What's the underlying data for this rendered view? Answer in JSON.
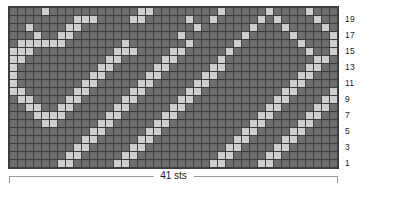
{
  "chart_data": {
    "type": "heatmap",
    "title": "",
    "subtitle": "",
    "xlabel": "41 sts",
    "ylabel": "",
    "columns": 41,
    "rows": 20,
    "grid_on": true,
    "legend_position": "none",
    "colors": {
      "background_stitch": "#6d6d6d",
      "contrast_stitch": "#cfcfcf",
      "cell_border": "#3f3f3f",
      "bracket": "#9a9a9a",
      "text": "#1c1c1c",
      "page_background": "#ffffff"
    },
    "legend_entries": [
      {
        "label": "background stitch",
        "value": 0,
        "color": "#6d6d6d"
      },
      {
        "label": "contrast stitch",
        "value": 1,
        "color": "#cfcfcf"
      }
    ],
    "row_labels": [
      "19",
      "17",
      "15",
      "13",
      "11",
      "9",
      "7",
      "5",
      "3",
      "1"
    ],
    "row_label_numbers": [
      19,
      17,
      15,
      13,
      11,
      9,
      7,
      5,
      3,
      1
    ],
    "row_label_side": "right",
    "row_order_top_to_bottom": [
      20,
      19,
      18,
      17,
      16,
      15,
      14,
      13,
      12,
      11,
      10,
      9,
      8,
      7,
      6,
      5,
      4,
      3,
      2,
      1
    ],
    "values": [
      [
        0,
        0,
        0,
        0,
        1,
        0,
        0,
        0,
        0,
        0,
        0,
        0,
        0,
        0,
        0,
        0,
        1,
        1,
        0,
        0,
        0,
        0,
        0,
        0,
        0,
        0,
        1,
        0,
        0,
        0,
        0,
        0,
        1,
        0,
        0,
        0,
        0,
        1,
        0,
        0,
        0
      ],
      [
        0,
        0,
        0,
        0,
        0,
        0,
        0,
        0,
        1,
        1,
        1,
        0,
        0,
        0,
        0,
        1,
        1,
        0,
        0,
        0,
        0,
        0,
        1,
        0,
        0,
        1,
        0,
        0,
        0,
        0,
        0,
        1,
        0,
        1,
        0,
        0,
        0,
        0,
        1,
        0,
        0
      ],
      [
        0,
        0,
        1,
        0,
        0,
        0,
        0,
        1,
        1,
        0,
        0,
        0,
        0,
        0,
        0,
        0,
        0,
        0,
        0,
        0,
        0,
        0,
        0,
        1,
        0,
        0,
        0,
        0,
        0,
        0,
        1,
        0,
        0,
        0,
        1,
        0,
        0,
        0,
        0,
        1,
        0
      ],
      [
        0,
        0,
        0,
        1,
        0,
        0,
        1,
        1,
        0,
        0,
        0,
        0,
        0,
        0,
        0,
        0,
        0,
        0,
        0,
        0,
        0,
        1,
        0,
        0,
        0,
        0,
        0,
        0,
        0,
        1,
        0,
        0,
        0,
        0,
        0,
        1,
        0,
        0,
        0,
        0,
        1
      ],
      [
        0,
        1,
        1,
        1,
        1,
        1,
        1,
        0,
        0,
        0,
        0,
        0,
        0,
        0,
        1,
        0,
        0,
        0,
        0,
        0,
        0,
        0,
        1,
        0,
        0,
        0,
        0,
        0,
        1,
        0,
        0,
        0,
        0,
        0,
        0,
        0,
        1,
        0,
        0,
        0,
        1
      ],
      [
        1,
        1,
        1,
        0,
        0,
        0,
        0,
        0,
        0,
        0,
        0,
        0,
        0,
        1,
        1,
        1,
        0,
        0,
        0,
        0,
        1,
        1,
        0,
        0,
        0,
        0,
        0,
        1,
        0,
        0,
        0,
        0,
        0,
        0,
        0,
        0,
        0,
        1,
        0,
        0,
        1
      ],
      [
        1,
        1,
        0,
        0,
        0,
        0,
        0,
        0,
        0,
        0,
        0,
        0,
        1,
        1,
        0,
        0,
        0,
        0,
        0,
        1,
        1,
        0,
        0,
        0,
        0,
        0,
        1,
        0,
        0,
        0,
        0,
        0,
        0,
        0,
        0,
        0,
        0,
        0,
        1,
        1,
        0
      ],
      [
        1,
        0,
        0,
        0,
        0,
        0,
        0,
        0,
        0,
        0,
        0,
        1,
        1,
        0,
        0,
        0,
        0,
        0,
        1,
        1,
        0,
        0,
        0,
        0,
        0,
        1,
        1,
        0,
        0,
        0,
        0,
        0,
        0,
        0,
        0,
        0,
        0,
        1,
        1,
        0,
        0
      ],
      [
        1,
        0,
        0,
        0,
        0,
        0,
        0,
        0,
        0,
        0,
        1,
        1,
        0,
        0,
        0,
        0,
        0,
        1,
        1,
        0,
        0,
        0,
        0,
        0,
        1,
        1,
        0,
        0,
        0,
        0,
        0,
        0,
        0,
        0,
        0,
        0,
        1,
        1,
        0,
        0,
        0
      ],
      [
        1,
        0,
        0,
        0,
        0,
        0,
        0,
        0,
        0,
        1,
        1,
        0,
        0,
        0,
        0,
        0,
        1,
        1,
        0,
        0,
        0,
        0,
        0,
        1,
        1,
        0,
        0,
        0,
        0,
        0,
        0,
        0,
        0,
        0,
        0,
        1,
        1,
        0,
        0,
        0,
        0
      ],
      [
        1,
        1,
        0,
        0,
        0,
        0,
        0,
        0,
        1,
        1,
        0,
        0,
        0,
        0,
        0,
        1,
        1,
        0,
        0,
        0,
        0,
        0,
        1,
        1,
        0,
        0,
        0,
        0,
        0,
        0,
        0,
        0,
        0,
        0,
        1,
        1,
        0,
        0,
        0,
        0,
        1
      ],
      [
        0,
        1,
        1,
        0,
        0,
        0,
        0,
        1,
        1,
        0,
        0,
        0,
        0,
        0,
        1,
        1,
        0,
        0,
        0,
        0,
        0,
        1,
        1,
        0,
        0,
        0,
        0,
        0,
        0,
        0,
        0,
        0,
        0,
        1,
        1,
        0,
        0,
        0,
        0,
        1,
        1
      ],
      [
        0,
        0,
        1,
        1,
        0,
        0,
        1,
        1,
        0,
        0,
        0,
        0,
        0,
        1,
        1,
        0,
        0,
        0,
        0,
        0,
        1,
        1,
        0,
        0,
        0,
        0,
        0,
        0,
        0,
        0,
        0,
        0,
        1,
        1,
        0,
        0,
        0,
        0,
        1,
        1,
        0
      ],
      [
        0,
        0,
        0,
        1,
        1,
        1,
        1,
        0,
        0,
        0,
        0,
        0,
        1,
        1,
        0,
        0,
        0,
        0,
        0,
        1,
        1,
        0,
        0,
        0,
        0,
        0,
        0,
        0,
        0,
        0,
        0,
        1,
        1,
        0,
        0,
        0,
        0,
        1,
        1,
        0,
        0
      ],
      [
        0,
        0,
        0,
        0,
        1,
        1,
        0,
        0,
        0,
        0,
        0,
        1,
        1,
        0,
        0,
        0,
        0,
        0,
        1,
        1,
        0,
        0,
        0,
        0,
        0,
        0,
        0,
        0,
        0,
        0,
        1,
        1,
        0,
        0,
        0,
        0,
        1,
        1,
        0,
        0,
        0
      ],
      [
        0,
        0,
        0,
        0,
        0,
        0,
        0,
        0,
        0,
        0,
        1,
        1,
        0,
        0,
        0,
        0,
        0,
        1,
        1,
        0,
        0,
        0,
        0,
        0,
        0,
        0,
        0,
        0,
        0,
        1,
        1,
        0,
        0,
        0,
        0,
        1,
        1,
        0,
        0,
        0,
        0
      ],
      [
        0,
        0,
        0,
        0,
        0,
        0,
        0,
        0,
        0,
        1,
        1,
        0,
        0,
        0,
        0,
        0,
        1,
        1,
        0,
        0,
        0,
        0,
        0,
        0,
        0,
        0,
        0,
        0,
        1,
        1,
        0,
        0,
        0,
        0,
        1,
        1,
        0,
        0,
        0,
        0,
        0
      ],
      [
        0,
        0,
        0,
        0,
        0,
        0,
        0,
        0,
        1,
        1,
        0,
        0,
        0,
        0,
        0,
        1,
        1,
        0,
        0,
        0,
        0,
        0,
        0,
        0,
        0,
        0,
        0,
        1,
        1,
        0,
        0,
        0,
        0,
        1,
        1,
        0,
        0,
        0,
        0,
        0,
        0
      ],
      [
        0,
        0,
        0,
        0,
        0,
        0,
        0,
        1,
        1,
        0,
        0,
        0,
        0,
        0,
        1,
        1,
        0,
        0,
        0,
        0,
        0,
        0,
        0,
        0,
        0,
        0,
        1,
        1,
        0,
        0,
        0,
        0,
        1,
        1,
        0,
        0,
        0,
        0,
        0,
        0,
        0
      ],
      [
        0,
        0,
        0,
        0,
        0,
        0,
        1,
        1,
        0,
        0,
        0,
        0,
        0,
        1,
        1,
        0,
        0,
        0,
        0,
        0,
        0,
        0,
        0,
        0,
        0,
        1,
        1,
        0,
        0,
        0,
        0,
        1,
        1,
        0,
        0,
        0,
        0,
        0,
        0,
        0,
        0
      ]
    ]
  },
  "labels": {
    "width_label": "41 sts"
  }
}
